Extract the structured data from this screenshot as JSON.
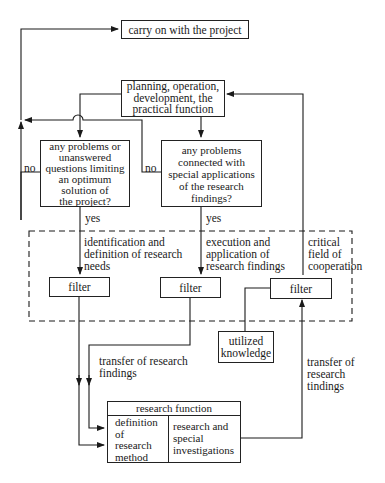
{
  "diagram": {
    "nodes": {
      "carry_on": "carry on with the project",
      "planning": "planning, operation,\ndevelopment, the\npractical function",
      "decision_left": "any problems or\nunanswered\nquestions limiting\nan optimum\nsolution of\nthe project?",
      "decision_right": "any problems\nconnected with\nspecial applications\nof the research\nfindings?",
      "filter_left": "filter",
      "filter_middle": "filter",
      "filter_right": "filter",
      "utilized_knowledge": "utilized\nknowledge",
      "research_function": {
        "title": "research function",
        "left_cell": "definition\nof\nresearch\nmethod",
        "right_cell": "research and\nspecial\ninvestigations"
      }
    },
    "edge_labels": {
      "no_left": "no",
      "no_right": "no",
      "yes_left": "yes",
      "yes_right": "yes",
      "identification": "identification and\ndefinition of research\nneeds",
      "execution": "execution and\napplication of\nresearch findings",
      "critical_field": "critical\nfield of\ncooperation",
      "transfer_left": "transfer of research\nfindings",
      "transfer_right": "transfer of\nresearch\ntindings"
    }
  }
}
